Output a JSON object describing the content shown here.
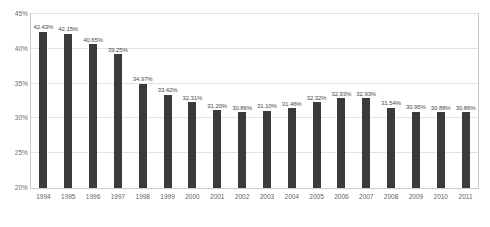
{
  "chart_data": {
    "type": "bar",
    "title": "",
    "xlabel": "",
    "ylabel": "",
    "ylim": [
      20,
      45
    ],
    "yticks": [
      "20%",
      "25%",
      "30%",
      "35%",
      "40%",
      "45%"
    ],
    "ytick_values": [
      20,
      25,
      30,
      35,
      40,
      45
    ],
    "grid": true,
    "legend": "none",
    "bar_color": "#3b3b3b",
    "categories": [
      "1994",
      "1995",
      "1996",
      "1997",
      "1998",
      "1999",
      "2000",
      "2001",
      "2002",
      "2003",
      "2004",
      "2005",
      "2006",
      "2007",
      "2008",
      "2009",
      "2010",
      "2011"
    ],
    "values": [
      42.43,
      42.15,
      40.65,
      39.25,
      34.97,
      33.42,
      32.31,
      31.2,
      30.86,
      31.1,
      31.46,
      32.32,
      32.93,
      32.93,
      31.54,
      30.95,
      30.88,
      30.86
    ],
    "data_labels": [
      "42.43%",
      "42.15%",
      "40.65%",
      "39.25%",
      "34.97%",
      "33.42%",
      "32.31%",
      "31.20%",
      "30.86%",
      "31.10%",
      "31.46%",
      "32.32%",
      "32.93%",
      "32.93%",
      "31.54%",
      "30.95%",
      "30.88%",
      "30.86%"
    ]
  }
}
